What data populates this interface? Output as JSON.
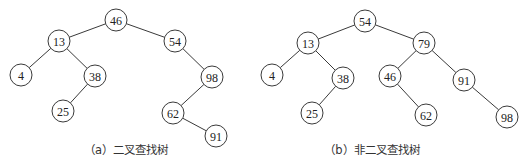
{
  "diagrams": [
    {
      "id": "a",
      "caption": "（a）二叉查找树",
      "caption_x": 126,
      "nodes": [
        {
          "label": "46",
          "x": 116,
          "y": 20
        },
        {
          "label": "13",
          "x": 59,
          "y": 41
        },
        {
          "label": "54",
          "x": 175,
          "y": 41
        },
        {
          "label": "4",
          "x": 21,
          "y": 75
        },
        {
          "label": "38",
          "x": 95,
          "y": 76
        },
        {
          "label": "98",
          "x": 212,
          "y": 77
        },
        {
          "label": "25",
          "x": 63,
          "y": 111
        },
        {
          "label": "62",
          "x": 173,
          "y": 113
        },
        {
          "label": "91",
          "x": 216,
          "y": 136
        }
      ],
      "edges": [
        [
          0,
          1
        ],
        [
          0,
          2
        ],
        [
          1,
          3
        ],
        [
          1,
          4
        ],
        [
          4,
          6
        ],
        [
          2,
          5
        ],
        [
          5,
          7
        ],
        [
          7,
          8
        ]
      ]
    },
    {
      "id": "b",
      "caption": "（b）非二叉查找树",
      "caption_x": 372,
      "nodes": [
        {
          "label": "54",
          "x": 365,
          "y": 21
        },
        {
          "label": "13",
          "x": 308,
          "y": 43
        },
        {
          "label": "79",
          "x": 424,
          "y": 43
        },
        {
          "label": "4",
          "x": 272,
          "y": 75
        },
        {
          "label": "38",
          "x": 343,
          "y": 78
        },
        {
          "label": "46",
          "x": 390,
          "y": 76
        },
        {
          "label": "91",
          "x": 464,
          "y": 80
        },
        {
          "label": "25",
          "x": 312,
          "y": 113
        },
        {
          "label": "62",
          "x": 426,
          "y": 115
        },
        {
          "label": "98",
          "x": 507,
          "y": 117
        }
      ],
      "edges": [
        [
          0,
          1
        ],
        [
          0,
          2
        ],
        [
          1,
          3
        ],
        [
          1,
          4
        ],
        [
          4,
          7
        ],
        [
          2,
          5
        ],
        [
          2,
          6
        ],
        [
          5,
          8
        ],
        [
          6,
          9
        ]
      ]
    }
  ],
  "style": {
    "node_radius": 11,
    "stroke": "#3a3a3a",
    "background": "#ffffff"
  }
}
